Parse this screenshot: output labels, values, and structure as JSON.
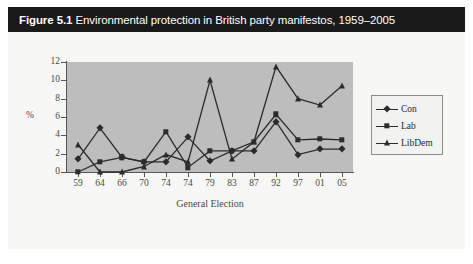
{
  "figure": {
    "label": "Figure 5.1",
    "caption": "Environmental protection in British party manifestos, 1959–2005",
    "caption_full": "Figure 5.1 Environmental protection in British party manifestos, 1959–2005"
  },
  "colors": {
    "caption_bar_background": "#1a1a1a",
    "caption_text": "#ffffff",
    "figure_background": "#f7f7f5",
    "plot_background": "#bdbdbd",
    "axis_line": "#555555",
    "series_ink": "#2b2b2b",
    "legend_background": "#f2f2f0",
    "legend_border": "#8c8c8c"
  },
  "legend": {
    "position": "right",
    "entries": [
      {
        "label": "Con",
        "marker": "diamond"
      },
      {
        "label": "Lab",
        "marker": "square"
      },
      {
        "label": "LibDem",
        "marker": "triangle"
      }
    ]
  },
  "chart_data": {
    "type": "line",
    "title": "Environmental protection in British party manifestos, 1959–2005",
    "xlabel": "General Election",
    "ylabel": "%",
    "categories": [
      "59",
      "64",
      "66",
      "70",
      "74",
      "74",
      "79",
      "83",
      "87",
      "92",
      "97",
      "01",
      "05"
    ],
    "xtick_labels": [
      "59",
      "64",
      "66",
      "70",
      "74",
      "74",
      "79",
      "83",
      "87",
      "92",
      "97",
      "01",
      "05"
    ],
    "ytick_labels": [
      "0",
      "2",
      "4",
      "6",
      "8",
      "10",
      "12"
    ],
    "ytick_values": [
      0,
      2,
      4,
      6,
      8,
      10,
      12
    ],
    "ylim": [
      0,
      12
    ],
    "grid": false,
    "legend_position": "right",
    "series": [
      {
        "name": "Con",
        "marker": "diamond",
        "values": [
          1.4,
          4.8,
          1.6,
          1.1,
          1.1,
          3.8,
          1.2,
          2.3,
          2.3,
          5.5,
          1.9,
          2.5,
          2.5
        ]
      },
      {
        "name": "Lab",
        "marker": "square",
        "values": [
          0.0,
          1.1,
          1.6,
          1.1,
          4.4,
          0.5,
          2.3,
          2.3,
          3.3,
          6.3,
          3.5,
          3.6,
          3.5
        ]
      },
      {
        "name": "LibDem",
        "marker": "triangle",
        "values": [
          3.0,
          0.0,
          0.0,
          0.6,
          1.9,
          1.1,
          10.0,
          1.4,
          3.3,
          11.5,
          8.0,
          7.3,
          9.4
        ]
      }
    ]
  }
}
